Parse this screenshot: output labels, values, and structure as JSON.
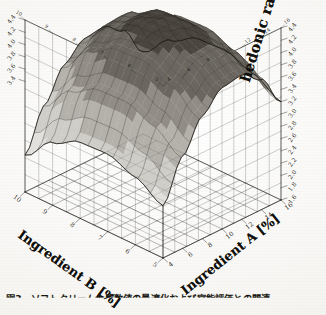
{
  "figure": {
    "caption": "図3　ソフトクリーム食感数値の最適化および官能評価との関連",
    "background_color": "#f7f6f3",
    "ink_color": "#15140f"
  },
  "chart_data": {
    "type": "surface",
    "title": "",
    "projection": "3d-wireframe-surface",
    "xlabel": "Ingredient A [%]",
    "ylabel": "Ingredient B [%]",
    "zlabel": "hedonic ratings",
    "grid": true,
    "legend": "none",
    "xlim": [
      4,
      16
    ],
    "ylim": [
      5,
      10
    ],
    "zlim": [
      1.6,
      4.4
    ],
    "x_ticks": [
      4,
      6,
      8,
      10,
      12,
      14,
      16
    ],
    "y_ticks": [
      5,
      6,
      7,
      8,
      9,
      10
    ],
    "z_ticks": [
      1.6,
      1.8,
      2.0,
      2.2,
      2.4,
      2.6,
      2.8,
      3.0,
      3.2,
      3.4,
      3.6,
      3.8,
      4.0,
      4.2,
      4.4
    ],
    "z_ticks_left": [
      3.4,
      3.6,
      3.8,
      4.0,
      4.2,
      4.4
    ],
    "z_ticks_right": [
      1.6,
      1.8,
      2.0,
      2.2,
      2.4,
      2.6,
      2.8,
      3.0,
      3.2,
      3.4,
      3.6,
      3.8,
      4.0,
      4.2,
      4.4
    ],
    "x": [
      4,
      6,
      8,
      10,
      12,
      14,
      16
    ],
    "y": [
      5,
      6,
      7,
      8,
      9,
      10
    ],
    "z": [
      [
        2.45,
        3.1,
        3.6,
        3.9,
        3.95,
        3.72,
        3.2
      ],
      [
        2.7,
        3.4,
        3.92,
        4.18,
        4.2,
        3.96,
        3.44
      ],
      [
        2.86,
        3.58,
        4.12,
        4.36,
        4.36,
        4.12,
        3.6
      ],
      [
        2.84,
        3.56,
        4.1,
        4.34,
        4.34,
        4.1,
        3.58
      ],
      [
        2.62,
        3.32,
        3.84,
        4.08,
        4.1,
        3.86,
        3.34
      ],
      [
        2.2,
        2.86,
        3.36,
        3.62,
        3.66,
        3.44,
        2.94
      ]
    ],
    "surface_shading": "grayscale-contour-bands",
    "contour_band_levels": [
      2.2,
      2.6,
      3.0,
      3.4,
      3.8,
      4.2
    ],
    "peak": {
      "x": 11,
      "y": 7.3,
      "z": 4.4
    }
  },
  "axes": {
    "z_right": {
      "label": "hedonic ratings"
    },
    "x_front_right": {
      "label": "Ingredient A [%]"
    },
    "y_front_left": {
      "label": "Ingredient B [%]"
    }
  }
}
